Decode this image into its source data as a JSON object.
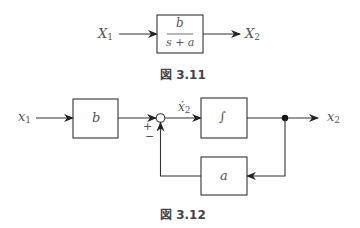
{
  "figure_3_11": {
    "input_label": "X",
    "input_sub": "1",
    "output_label": "X",
    "output_sub": "2",
    "block_numerator": "b",
    "block_denominator": "s + a",
    "caption": "図 3.11"
  },
  "figure_3_12": {
    "input_label": "x",
    "input_sub": "1",
    "gain_block": "b",
    "sum_plus": "+",
    "sum_minus": "−",
    "derivative_label": "ẋ",
    "derivative_sub": "2",
    "integrator_block": "∫",
    "feedback_block": "a",
    "output_label": "x",
    "output_sub": "2",
    "caption": "図 3.12"
  }
}
